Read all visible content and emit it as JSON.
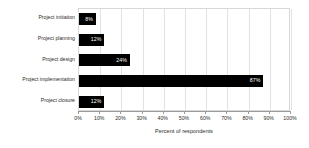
{
  "chart_data": {
    "type": "bar",
    "orientation": "horizontal",
    "title": "",
    "xlabel": "Percent of respondents",
    "ylabel": "",
    "categories": [
      "Project initiation",
      "Project planning",
      "Project design",
      "Project implementation",
      "Project closure"
    ],
    "values": [
      8,
      12,
      24,
      87,
      12
    ],
    "value_labels": [
      "8%",
      "12%",
      "24%",
      "87%",
      "12%"
    ],
    "xlim": [
      0,
      100
    ],
    "xticks": [
      0,
      10,
      20,
      30,
      40,
      50,
      60,
      70,
      80,
      90,
      100
    ],
    "xtick_labels": [
      "0%",
      "10%",
      "20%",
      "30%",
      "40%",
      "50%",
      "60%",
      "70%",
      "80%",
      "90%",
      "100%"
    ],
    "grid": "vertical",
    "legend": "none",
    "bar_color": "#000000",
    "value_label_color": "#ffffff",
    "gridline_color": "#e2e2e2",
    "plot_border_color": "#d8d8d8",
    "axis_color": "#9a9a9a",
    "background_color": "#ffffff"
  }
}
